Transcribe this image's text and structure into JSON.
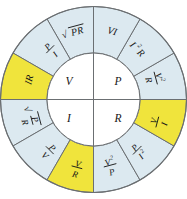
{
  "diagram": {
    "colors": {
      "blue": "#dce9f0",
      "yellow": "#f0e43c",
      "white": "#ffffff",
      "line": "#6b6f72",
      "text": "#161616",
      "background": "#ffffff"
    },
    "core": {
      "quadrants": [
        {
          "id": "core-v",
          "label": "V",
          "position": "top-left"
        },
        {
          "id": "core-p",
          "label": "P",
          "position": "top-right"
        },
        {
          "id": "core-i",
          "label": "I",
          "position": "bottom-left"
        },
        {
          "id": "core-r",
          "label": "R",
          "position": "bottom-right"
        }
      ]
    },
    "ring": {
      "segments": [
        {
          "id": "seg-vi",
          "text": "VI",
          "kind": "simple",
          "fill": "blue",
          "group": "P"
        },
        {
          "id": "seg-i2r",
          "text": "I²R",
          "kind": "super",
          "base": "I",
          "sup": "2",
          "tail": "R",
          "fill": "blue",
          "group": "P"
        },
        {
          "id": "seg-v2-r",
          "text": "V²/R",
          "kind": "fraction",
          "num": "V",
          "num_sup": "2",
          "den": "R",
          "fill": "blue",
          "group": "P"
        },
        {
          "id": "seg-v-i",
          "text": "V/I",
          "kind": "fraction",
          "num": "V",
          "den": "I",
          "fill": "yellow",
          "group": "R"
        },
        {
          "id": "seg-p-i2",
          "text": "P/I²",
          "kind": "fraction",
          "num": "P",
          "den": "I",
          "den_sup": "2",
          "fill": "blue",
          "group": "R"
        },
        {
          "id": "seg-v2-p",
          "text": "V²/P",
          "kind": "fraction",
          "num": "V",
          "num_sup": "2",
          "den": "P",
          "fill": "blue",
          "group": "R"
        },
        {
          "id": "seg-v-r",
          "text": "V/R",
          "kind": "fraction",
          "num": "V",
          "den": "R",
          "fill": "yellow",
          "group": "I"
        },
        {
          "id": "seg-p-v",
          "text": "P/V",
          "kind": "fraction",
          "num": "P",
          "den": "V",
          "fill": "blue",
          "group": "I"
        },
        {
          "id": "seg-sqrt-p-r",
          "text": "√(P/R)",
          "kind": "sqrt-fraction",
          "num": "P",
          "den": "R",
          "fill": "blue",
          "group": "I"
        },
        {
          "id": "seg-ir",
          "text": "IR",
          "kind": "simple",
          "fill": "yellow",
          "group": "V"
        },
        {
          "id": "seg-p-i",
          "text": "P/I",
          "kind": "fraction",
          "num": "P",
          "den": "I",
          "fill": "blue",
          "group": "V"
        },
        {
          "id": "seg-sqrt-pr",
          "text": "√PR",
          "kind": "sqrt-simple",
          "radicand": "PR",
          "fill": "blue",
          "group": "V"
        }
      ]
    }
  }
}
